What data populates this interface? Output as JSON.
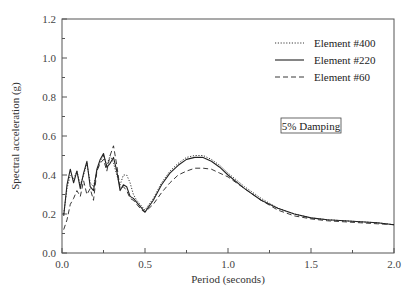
{
  "chart_data": {
    "type": "line",
    "title": "",
    "xlabel": "Period (seconds)",
    "ylabel": "Spectral acceleration (g)",
    "xlim": [
      0.0,
      2.0
    ],
    "ylim": [
      0.0,
      1.2
    ],
    "xticks": [
      "0.0",
      "0.5",
      "1.0",
      "1.5",
      "2.0"
    ],
    "yticks": [
      "0.0",
      "0.2",
      "0.4",
      "0.6",
      "0.8",
      "1.0",
      "1.2"
    ],
    "grid": false,
    "legend_position": "upper right",
    "annotation": "5% Damping",
    "series": [
      {
        "name": "Element #400",
        "style": "dotted",
        "x": [
          0.01,
          0.03,
          0.05,
          0.07,
          0.09,
          0.11,
          0.13,
          0.15,
          0.17,
          0.19,
          0.21,
          0.23,
          0.25,
          0.27,
          0.29,
          0.31,
          0.33,
          0.35,
          0.37,
          0.39,
          0.41,
          0.43,
          0.45,
          0.48,
          0.5,
          0.55,
          0.6,
          0.65,
          0.7,
          0.75,
          0.8,
          0.85,
          0.9,
          0.95,
          1.0,
          1.1,
          1.2,
          1.3,
          1.4,
          1.5,
          1.6,
          1.7,
          1.8,
          1.9,
          2.0
        ],
        "y": [
          0.2,
          0.33,
          0.4,
          0.38,
          0.42,
          0.35,
          0.4,
          0.46,
          0.36,
          0.34,
          0.42,
          0.47,
          0.5,
          0.45,
          0.5,
          0.46,
          0.4,
          0.35,
          0.4,
          0.4,
          0.36,
          0.3,
          0.27,
          0.24,
          0.22,
          0.28,
          0.36,
          0.42,
          0.46,
          0.49,
          0.5,
          0.5,
          0.48,
          0.45,
          0.41,
          0.34,
          0.28,
          0.23,
          0.2,
          0.18,
          0.17,
          0.165,
          0.16,
          0.155,
          0.145
        ]
      },
      {
        "name": "Element #220",
        "style": "solid",
        "x": [
          0.01,
          0.03,
          0.05,
          0.07,
          0.09,
          0.11,
          0.13,
          0.15,
          0.17,
          0.19,
          0.21,
          0.23,
          0.25,
          0.27,
          0.29,
          0.31,
          0.33,
          0.35,
          0.37,
          0.39,
          0.41,
          0.43,
          0.45,
          0.48,
          0.5,
          0.55,
          0.6,
          0.65,
          0.7,
          0.75,
          0.8,
          0.85,
          0.9,
          0.95,
          1.0,
          1.1,
          1.2,
          1.3,
          1.4,
          1.5,
          1.6,
          1.7,
          1.8,
          1.9,
          2.0
        ],
        "y": [
          0.19,
          0.35,
          0.43,
          0.36,
          0.42,
          0.33,
          0.41,
          0.47,
          0.34,
          0.32,
          0.43,
          0.48,
          0.51,
          0.44,
          0.46,
          0.49,
          0.42,
          0.32,
          0.35,
          0.34,
          0.29,
          0.28,
          0.26,
          0.23,
          0.21,
          0.27,
          0.35,
          0.41,
          0.45,
          0.48,
          0.49,
          0.49,
          0.47,
          0.44,
          0.4,
          0.33,
          0.27,
          0.23,
          0.2,
          0.18,
          0.17,
          0.165,
          0.16,
          0.155,
          0.145
        ]
      },
      {
        "name": "Element #60",
        "style": "dashed",
        "x": [
          0.01,
          0.03,
          0.05,
          0.07,
          0.09,
          0.11,
          0.13,
          0.15,
          0.17,
          0.19,
          0.21,
          0.23,
          0.25,
          0.27,
          0.29,
          0.31,
          0.33,
          0.35,
          0.37,
          0.39,
          0.41,
          0.43,
          0.45,
          0.48,
          0.5,
          0.55,
          0.6,
          0.65,
          0.7,
          0.75,
          0.8,
          0.85,
          0.9,
          0.95,
          1.0,
          1.1,
          1.2,
          1.3,
          1.4,
          1.5,
          1.6,
          1.7,
          1.8,
          1.9,
          2.0
        ],
        "y": [
          0.12,
          0.17,
          0.25,
          0.28,
          0.32,
          0.29,
          0.37,
          0.3,
          0.33,
          0.27,
          0.42,
          0.46,
          0.48,
          0.42,
          0.5,
          0.55,
          0.45,
          0.33,
          0.34,
          0.32,
          0.28,
          0.27,
          0.25,
          0.22,
          0.21,
          0.25,
          0.31,
          0.36,
          0.4,
          0.42,
          0.435,
          0.435,
          0.43,
          0.41,
          0.39,
          0.33,
          0.27,
          0.22,
          0.19,
          0.175,
          0.165,
          0.16,
          0.155,
          0.15,
          0.145
        ]
      }
    ]
  }
}
